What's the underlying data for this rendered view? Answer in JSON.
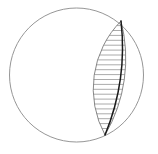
{
  "figure": {
    "canvas": {
      "width": 158,
      "height": 154,
      "background": "#ffffff"
    },
    "circle": {
      "name": "outer-circle",
      "cx": 76.5,
      "cy": 75.0,
      "r": 67.0,
      "stroke": "#8a8a8a",
      "stroke_width": 0.9,
      "fill": "none"
    },
    "lens": {
      "name": "lens-region",
      "top_vertex": {
        "x": 121.0,
        "y": 21.0
      },
      "bottom_vertex": {
        "x": 105.0,
        "y": 135.0
      },
      "left_arc": {
        "name": "lens-left-arc",
        "rx": 96,
        "ry": 96,
        "sweep": 0,
        "stroke": "#7a7a7a",
        "stroke_width": 0.9
      },
      "right_arc": {
        "name": "lens-right-arc",
        "rx": 150,
        "ry": 150,
        "sweep": 1,
        "stroke": "#7a7a7a",
        "stroke_width": 0.9
      },
      "midrib": {
        "name": "lens-midrib",
        "rx": 230,
        "ry": 230,
        "sweep": 1,
        "stroke": "#1a1a1a",
        "stroke_width": 1.5
      }
    },
    "hatching": {
      "name": "lens-hatching",
      "count": 23,
      "stroke": "#8f8f8f",
      "stroke_width": 0.75,
      "orientation": "horizontal",
      "spacing_px": 4.9
    },
    "chart_data": {
      "type": "scatter",
      "title": "hatched lens inscribed in circle",
      "xlabel": "",
      "ylabel": "",
      "xlim": [
        0,
        158
      ],
      "ylim": [
        0,
        154
      ],
      "grid": false,
      "legend": null,
      "annotations": [],
      "series": [
        {
          "name": "outer-circle",
          "shape": "circle",
          "center": [
            76.5,
            75.0
          ],
          "radius": 67.0,
          "values": []
        },
        {
          "name": "lens-outline",
          "shape": "lens",
          "vertices": [
            [
              121.0,
              21.0
            ],
            [
              105.0,
              135.0
            ]
          ],
          "values": []
        },
        {
          "name": "lens-midrib",
          "shape": "arc",
          "vertices": [
            [
              121.0,
              21.0
            ],
            [
              105.0,
              135.0
            ]
          ],
          "values": []
        },
        {
          "name": "hatch-lines",
          "shape": "lines",
          "count": 23,
          "values": [
            25.6,
            30.5,
            35.4,
            40.3,
            45.2,
            50.1,
            55.0,
            59.9,
            64.8,
            69.7,
            74.6,
            79.5,
            84.4,
            89.3,
            94.2,
            99.1,
            104.0,
            108.9,
            113.8,
            118.7,
            123.6,
            128.5,
            133.4
          ]
        }
      ]
    }
  }
}
